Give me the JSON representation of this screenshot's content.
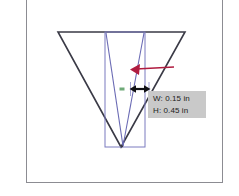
{
  "app": {
    "canvas_background": "#ffffff",
    "frame_border_color": "#8c8c92"
  },
  "shapes": {
    "outer_triangle": {
      "name": "outer-triangle",
      "stroke": "#3a3a46",
      "stroke_width": 1.6,
      "points": "58,32 185,32 121,147"
    },
    "selection_rectangle": {
      "name": "selection-rectangle",
      "stroke": "#7b7bbf",
      "stroke_width": 1,
      "x": 105,
      "y": 32,
      "width": 40,
      "height": 115
    },
    "inner_triangle": {
      "name": "inner-triangle",
      "stroke": "#6a6ab4",
      "stroke_width": 1,
      "points": "106,33 144,33 123,146"
    },
    "inner_triangle_left_line": {
      "name": "inner-triangle-left-edge",
      "stroke": "#6a6ab4",
      "points": "106,33 123,146"
    },
    "inner_triangle_right_line": {
      "name": "inner-triangle-right-edge",
      "stroke": "#6a6ab4",
      "points": "144,33 123,146"
    }
  },
  "annotations": {
    "red_arrow": {
      "name": "red-pointer-arrow",
      "color": "#b01c40",
      "from_x": 174,
      "from_y": 67,
      "to_x": 131,
      "to_y": 69,
      "stroke_width": 1.6
    },
    "dimension_arrow": {
      "name": "width-dimension-arrow",
      "color": "#101014",
      "from_x": 131,
      "from_y": 89,
      "to_x": 149,
      "to_y": 89,
      "stroke_width": 2
    },
    "green_marker": {
      "name": "green-anchor-marker",
      "color": "#6faa78",
      "x": 120,
      "y": 88,
      "width": 5,
      "height": 3
    },
    "guide_tick_left": {
      "name": "guide-tick-left",
      "color": "#7b7bbf",
      "x": 130,
      "y1": 83,
      "y2": 95
    },
    "guide_tick_right": {
      "name": "guide-tick-right",
      "color": "#7b7bbf",
      "x": 149,
      "y1": 83,
      "y2": 95
    }
  },
  "tooltip": {
    "name": "dimension-tooltip",
    "background": "#c9c9c9",
    "text_color": "#1c1c20",
    "width_label": "W: 0.15 in",
    "height_label": "H: 0.45 in"
  }
}
